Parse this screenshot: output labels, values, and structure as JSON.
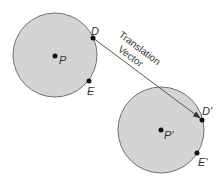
{
  "diagram": {
    "original": {
      "center_label": "P",
      "point1_label": "D",
      "point2_label": "E"
    },
    "image": {
      "center_label": "P'",
      "point1_label": "D'",
      "point2_label": "E'"
    },
    "vector_label_line1": "Translation",
    "vector_label_line2": "Vector",
    "colors": {
      "circle_fill": "#d4d4d4",
      "circle_stroke": "#707070",
      "line": "#555555",
      "point": "#111111"
    }
  }
}
